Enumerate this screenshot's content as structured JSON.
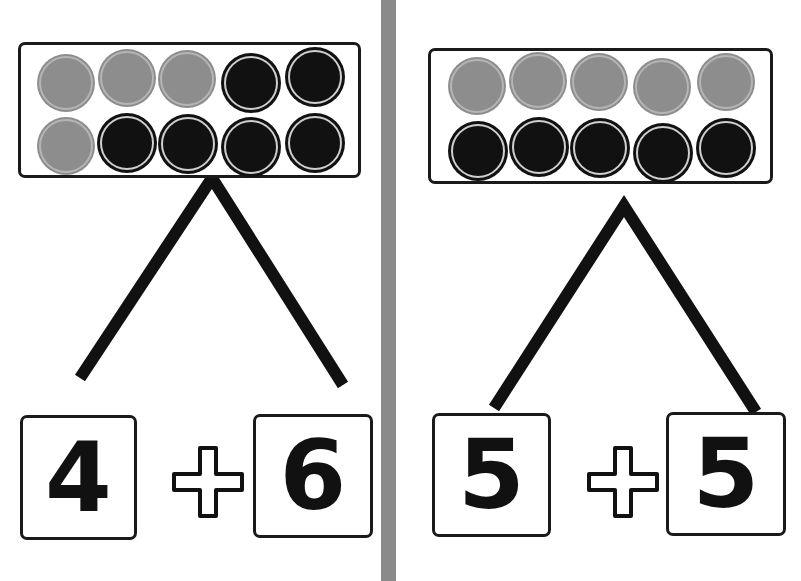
{
  "colors": {
    "gray_counter": "#8d8d8d",
    "black_counter": "#111111",
    "divider": "#8a8a8a",
    "stroke": "#1a1a1a"
  },
  "panels": [
    {
      "frame": {
        "rows": [
          [
            "gray",
            "gray",
            "gray",
            "black",
            "black"
          ],
          [
            "gray",
            "black",
            "black",
            "black",
            "black"
          ]
        ]
      },
      "gray_count": 4,
      "black_count": 6,
      "left_value": "4",
      "operator": "+",
      "right_value": "6"
    },
    {
      "frame": {
        "rows": [
          [
            "gray",
            "gray",
            "gray",
            "gray",
            "gray"
          ],
          [
            "black",
            "black",
            "black",
            "black",
            "black"
          ]
        ]
      },
      "gray_count": 5,
      "black_count": 5,
      "left_value": "5",
      "operator": "+",
      "right_value": "5"
    }
  ]
}
